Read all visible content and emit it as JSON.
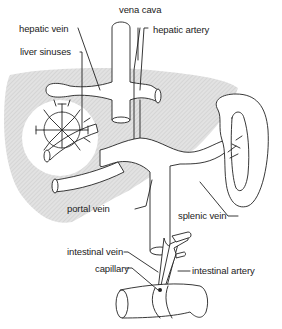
{
  "diagram": {
    "labels": {
      "vena_cava": "vena cava",
      "hepatic_vein": "hepatic vein",
      "hepatic_artery": "hepatic artery",
      "liver_sinuses": "liver sinuses",
      "portal_vein": "portal vein",
      "splenic_vein": "splenic vein",
      "intestinal_vein": "intestinal vein",
      "capillary": "capillary",
      "intestinal_artery": "intestinal artery"
    },
    "colors": {
      "liver_fill": "#d6d6d6",
      "line": "#222222",
      "background": "#ffffff"
    }
  }
}
